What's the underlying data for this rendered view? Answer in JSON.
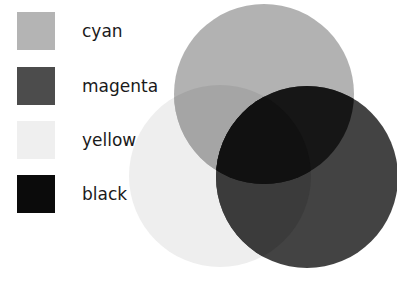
{
  "legend": {
    "items": [
      {
        "label": "cyan",
        "color": "#b4b4b4"
      },
      {
        "label": "magenta",
        "color": "#4c4c4c"
      },
      {
        "label": "yellow",
        "color": "#efefef"
      },
      {
        "label": "black",
        "color": "#0b0b0b"
      }
    ]
  },
  "diagram": {
    "circles": [
      {
        "name": "yellow",
        "cx": 220,
        "cy": 176,
        "r": 91,
        "color": "#eeeeee"
      },
      {
        "name": "cyan",
        "cx": 264,
        "cy": 94,
        "r": 90,
        "color": "#a8a8a8"
      },
      {
        "name": "magenta",
        "cx": 307,
        "cy": 177,
        "r": 91,
        "color": "#3a3a3a"
      }
    ]
  }
}
